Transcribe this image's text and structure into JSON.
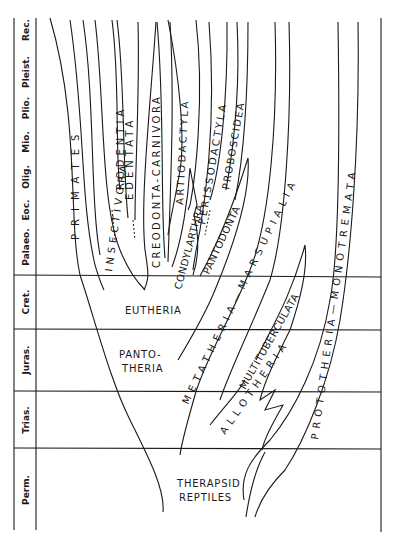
{
  "diagram": {
    "type": "phylogenetic-tree",
    "time_axis": {
      "periods": [
        {
          "label": "Rec.",
          "y_center": 30
        },
        {
          "label": "Pleist.",
          "y_center": 72
        },
        {
          "label": "Plio.",
          "y_center": 108
        },
        {
          "label": "Mio.",
          "y_center": 142
        },
        {
          "label": "Olig.",
          "y_center": 177
        },
        {
          "label": "Eoc.",
          "y_center": 210
        },
        {
          "label": "Palaeo.",
          "y_center": 247
        },
        {
          "label": "Cret.",
          "y_center": 302
        },
        {
          "label": "Juras.",
          "y_center": 360
        },
        {
          "label": "Trias.",
          "y_center": 420
        },
        {
          "label": "Perm.",
          "y_center": 490
        }
      ]
    },
    "groups": {
      "therapsid_line1": "THERAPSID",
      "therapsid_line2": "REPTILES",
      "eutheria": "EUTHERIA",
      "pantotheria_line1": "PANTO-",
      "pantotheria_line2": "THERIA",
      "allotheria": "ALLOTHERIA",
      "multituberculata": "MULTITUBERCULATA",
      "metatheria": "METATHERIA—MARSUPIALIA",
      "prototheria": "PROTOTHERIA—MONOTREMATA"
    },
    "orders": {
      "primates": "PRIMATES",
      "insectivora": "INSECTIVORA",
      "rodentia": "RODENTIA",
      "edentata": "EDENTATA",
      "creodonta": "CREODONTA-CARNIVORA",
      "artiodactyla": "ARTIODACTYLA",
      "condylarthra": "CONDYLARTHRA",
      "perissodactyla": "PERISSODACTYLA",
      "proboscidea": "PROBOSCIDEA",
      "pantodonta": "PANTODONTA"
    }
  }
}
